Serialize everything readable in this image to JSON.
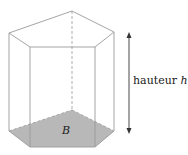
{
  "figure": {
    "type": "pentagonal prism",
    "height_label": {
      "text": "hauteur",
      "variable": "h"
    },
    "base_label": "B",
    "colors": {
      "edge": "#9a9a9a",
      "base_fill": "#b8b8b8",
      "arrow": "#333333",
      "text": "#1a1a1a"
    }
  }
}
